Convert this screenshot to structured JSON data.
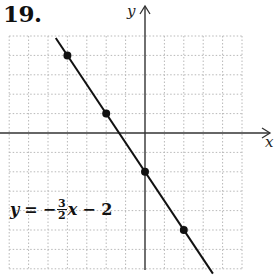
{
  "problem": {
    "number": "19."
  },
  "axes": {
    "x_label": "x",
    "y_label": "y"
  },
  "equation": {
    "lhs": "y",
    "equals": "=",
    "sign": "−",
    "frac_num": "3",
    "frac_den": "2",
    "var": "x",
    "tail": "− 2"
  },
  "colors": {
    "line": "#111111",
    "grid": "#b8b8b8",
    "axis": "#333333",
    "point": "#111111"
  },
  "chart_data": {
    "type": "line",
    "title": "19.",
    "xlabel": "x",
    "ylabel": "y",
    "equation": "y = -3/2 x - 2",
    "slope": -1.5,
    "intercept": -2,
    "xlim": [
      -7,
      5
    ],
    "ylim": [
      -7,
      5
    ],
    "grid": true,
    "grid_style": "dotted",
    "legend": null,
    "annotations": [
      "y = −(3/2)x − 2"
    ],
    "series": [
      {
        "name": "y = -3/2 x - 2",
        "points": [
          {
            "x": -4,
            "y": 4
          },
          {
            "x": -2,
            "y": 1
          },
          {
            "x": 0,
            "y": -2
          },
          {
            "x": 2,
            "y": -5
          }
        ],
        "line_extent": [
          {
            "x": -4.6,
            "y": 4.9
          },
          {
            "x": 3.5,
            "y": -7.25
          }
        ]
      }
    ]
  }
}
